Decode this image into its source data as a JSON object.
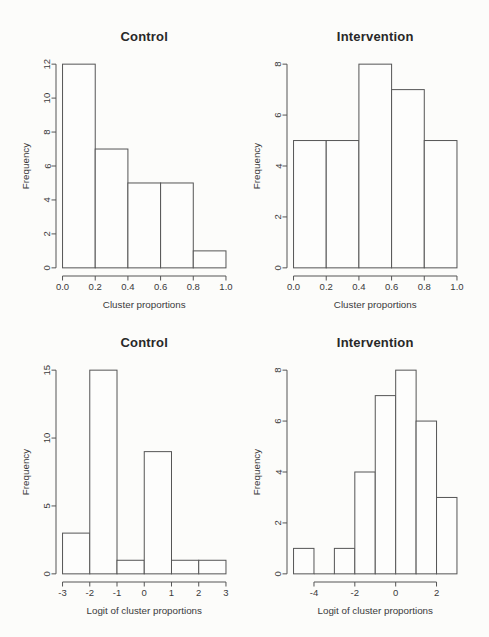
{
  "page": {
    "background": "#fcfcfa"
  },
  "colors": {
    "axis": "#555555",
    "bar_stroke": "#555555",
    "bar_fill": "#fdfdfc",
    "tick_text": "#3a3a3a",
    "label_text": "#3a3a3a",
    "title_text": "#282828"
  },
  "chart_data": [
    {
      "id": "control-proportions",
      "type": "bar",
      "variant": "histogram",
      "title": "Control",
      "xlabel": "Cluster proportions",
      "ylabel": "Frequency",
      "bin_edges": [
        0,
        0.2,
        0.4,
        0.6,
        0.8,
        1.0
      ],
      "counts": [
        12,
        7,
        5,
        5,
        1
      ],
      "xlim": [
        0,
        1
      ],
      "ylim": [
        0,
        12
      ],
      "x_ticks": [
        0,
        0.2,
        0.4,
        0.6,
        0.8,
        1
      ],
      "x_tick_labels": [
        "0.0",
        "0.2",
        "0.4",
        "0.6",
        "0.8",
        "1.0"
      ],
      "y_ticks": [
        0,
        2,
        4,
        6,
        8,
        10,
        12
      ],
      "y_tick_labels": [
        "0",
        "2",
        "4",
        "6",
        "8",
        "10",
        "12"
      ],
      "grid": false,
      "legend": false
    },
    {
      "id": "intervention-proportions",
      "type": "bar",
      "variant": "histogram",
      "title": "Intervention",
      "xlabel": "Cluster proportions",
      "ylabel": "Frequency",
      "bin_edges": [
        0,
        0.2,
        0.4,
        0.6,
        0.8,
        1.0
      ],
      "counts": [
        5,
        5,
        8,
        7,
        5
      ],
      "xlim": [
        0,
        1
      ],
      "ylim": [
        0,
        8
      ],
      "x_ticks": [
        0,
        0.2,
        0.4,
        0.6,
        0.8,
        1
      ],
      "x_tick_labels": [
        "0.0",
        "0.2",
        "0.4",
        "0.6",
        "0.8",
        "1.0"
      ],
      "y_ticks": [
        0,
        2,
        4,
        6,
        8
      ],
      "y_tick_labels": [
        "0",
        "2",
        "4",
        "6",
        "8"
      ],
      "grid": false,
      "legend": false
    },
    {
      "id": "control-logit",
      "type": "bar",
      "variant": "histogram",
      "title": "Control",
      "xlabel": "Logit of cluster proportions",
      "ylabel": "Frequency",
      "bin_edges": [
        -3,
        -2,
        -1,
        0,
        1,
        2,
        3
      ],
      "counts": [
        3,
        15,
        1,
        9,
        1,
        1
      ],
      "xlim": [
        -3,
        3
      ],
      "ylim": [
        0,
        15
      ],
      "x_ticks": [
        -3,
        -2,
        -1,
        0,
        1,
        2,
        3
      ],
      "x_tick_labels": [
        "-3",
        "-2",
        "-1",
        "0",
        "1",
        "2",
        "3"
      ],
      "y_ticks": [
        0,
        5,
        10,
        15
      ],
      "y_tick_labels": [
        "0",
        "5",
        "10",
        "15"
      ],
      "grid": false,
      "legend": false
    },
    {
      "id": "intervention-logit",
      "type": "bar",
      "variant": "histogram",
      "title": "Intervention",
      "xlabel": "Logit of cluster proportions",
      "ylabel": "Frequency",
      "bin_edges": [
        -5,
        -4,
        -3,
        -2,
        -1,
        0,
        1,
        2,
        3
      ],
      "counts": [
        1,
        0,
        1,
        4,
        7,
        8,
        6,
        3
      ],
      "xlim": [
        -5,
        3
      ],
      "ylim": [
        0,
        8
      ],
      "x_ticks": [
        -4,
        -2,
        0,
        2
      ],
      "x_tick_labels": [
        "-4",
        "-2",
        "0",
        "2"
      ],
      "y_ticks": [
        0,
        2,
        4,
        6,
        8
      ],
      "y_tick_labels": [
        "0",
        "2",
        "4",
        "6",
        "8"
      ],
      "grid": false,
      "legend": false
    }
  ]
}
